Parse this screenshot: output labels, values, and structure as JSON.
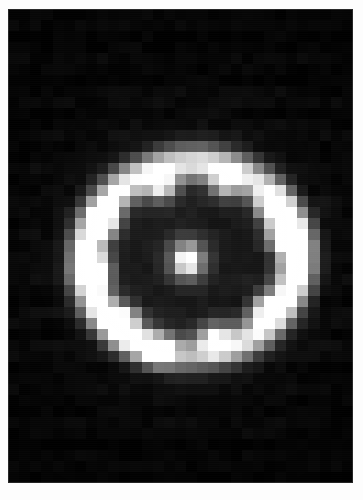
{
  "image": {
    "kind": "astronomical-observation",
    "subject_label": "Circumstellar ring with central point source",
    "caption": "",
    "width": 363,
    "height": 500,
    "background_color": "#fdfdfd",
    "plate": {
      "x": 8,
      "y": 9,
      "width": 345,
      "height": 474,
      "sky_color": "#050505",
      "border_color": "#787878"
    },
    "render": {
      "pixel_block_size": 11.2,
      "grid_cols": 31,
      "grid_rows": 43,
      "blur_radius_px": 3.0,
      "noise_amplitude": 0.035,
      "scanline_opacity": 0.03,
      "gamma": 1.0,
      "colormap": "grayscale",
      "peak_color": "#ffffff",
      "shadow_color": "#000000"
    },
    "features": {
      "ring": {
        "name": "equatorial-ring",
        "center_x": 182,
        "center_y": 248,
        "semi_major_axis": 106,
        "semi_minor_axis": 96,
        "position_angle_deg": -6,
        "thickness": 26,
        "mean_brightness": 0.52,
        "inner_cavity_brightness": 0.04
      },
      "central_source": {
        "name": "central-point-source",
        "x": 178,
        "y": 249,
        "radius": 13,
        "peak_brightness": 1.0
      },
      "halo": {
        "name": "diffuse-halo",
        "center_x": 182,
        "center_y": 248,
        "radius_x": 132,
        "radius_y": 124,
        "brightness": 0.1
      },
      "knots": [
        {
          "name": "knot-nw",
          "x": 152,
          "y": 176,
          "radius": 15,
          "brightness": 0.96
        },
        {
          "name": "knot-n",
          "x": 215,
          "y": 173,
          "radius": 15,
          "brightness": 0.78
        },
        {
          "name": "knot-ne",
          "x": 262,
          "y": 196,
          "radius": 15,
          "brightness": 0.92
        },
        {
          "name": "knot-e",
          "x": 273,
          "y": 224,
          "radius": 16,
          "brightness": 1.0
        },
        {
          "name": "knot-w",
          "x": 84,
          "y": 258,
          "radius": 17,
          "brightness": 1.0
        },
        {
          "name": "knot-nwo",
          "x": 96,
          "y": 212,
          "radius": 14,
          "brightness": 0.8
        },
        {
          "name": "knot-se",
          "x": 255,
          "y": 296,
          "radius": 14,
          "brightness": 0.74
        },
        {
          "name": "knot-s",
          "x": 205,
          "y": 328,
          "radius": 16,
          "brightness": 0.95
        },
        {
          "name": "knot-sw",
          "x": 148,
          "y": 338,
          "radius": 14,
          "brightness": 0.82
        },
        {
          "name": "knot-swo",
          "x": 117,
          "y": 305,
          "radius": 13,
          "brightness": 0.62
        }
      ],
      "field_stars": [
        {
          "name": "field-star-1",
          "x": 318,
          "y": 196,
          "radius": 3,
          "brightness": 0.3
        },
        {
          "name": "field-star-2",
          "x": 310,
          "y": 330,
          "radius": 3,
          "brightness": 0.22
        },
        {
          "name": "field-star-3",
          "x": 106,
          "y": 398,
          "radius": 2,
          "brightness": 0.18
        }
      ]
    }
  }
}
